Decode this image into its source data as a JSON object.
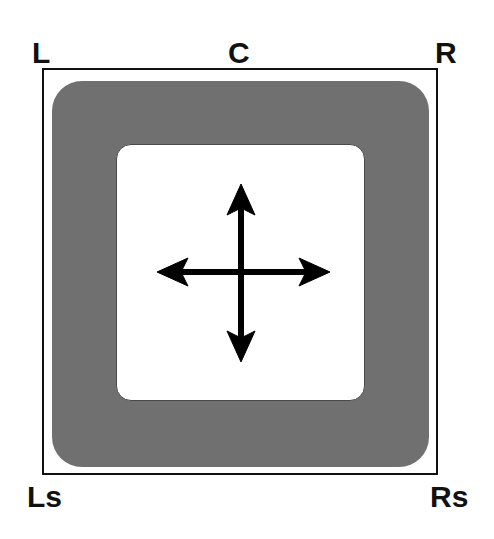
{
  "diagram": {
    "speakers": {
      "left": "L",
      "center": "C",
      "right": "R",
      "left_surround": "Ls",
      "right_surround": "Rs"
    },
    "center_icon": "four-way-arrows-icon",
    "colors": {
      "frame": "#111111",
      "outer_zone": "#707070",
      "inner_zone": "#ffffff",
      "arrows": "#000000",
      "labels": "#111111"
    }
  }
}
